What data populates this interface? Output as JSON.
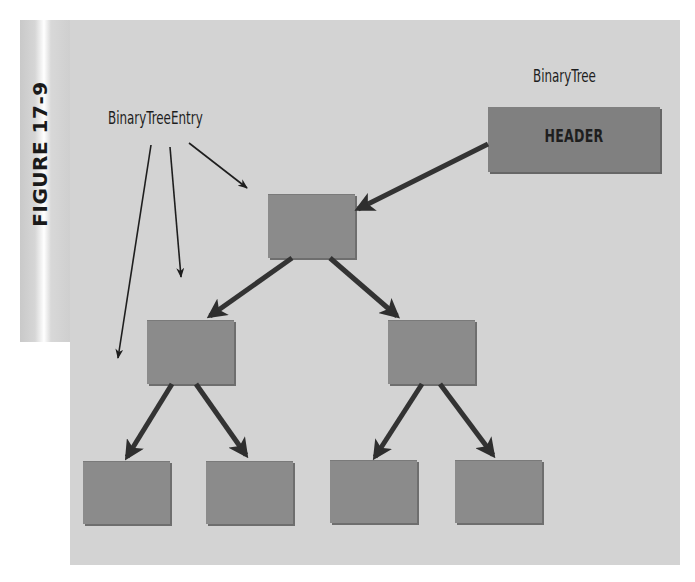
{
  "figure": {
    "label": "FIGURE 17-9"
  },
  "labels": {
    "entry": "BinaryTreeEntry",
    "tree": "BinaryTree",
    "header": "HEADER"
  },
  "colors": {
    "panel": "#d3d3d3",
    "node": "#8b8b8b",
    "header_node": "#808080",
    "arrow": "#333333"
  },
  "diagram": {
    "type": "binary-tree",
    "header_node": {
      "label": "HEADER",
      "points_to": "root"
    },
    "nodes": [
      {
        "id": "root",
        "level": 0
      },
      {
        "id": "left",
        "level": 1,
        "parent": "root"
      },
      {
        "id": "right",
        "level": 1,
        "parent": "root"
      },
      {
        "id": "left-left",
        "level": 2,
        "parent": "left"
      },
      {
        "id": "left-right",
        "level": 2,
        "parent": "left"
      },
      {
        "id": "right-left",
        "level": 2,
        "parent": "right"
      },
      {
        "id": "right-right",
        "level": 2,
        "parent": "right"
      }
    ],
    "annotation_targets": [
      "root",
      "left",
      "left-left"
    ]
  }
}
